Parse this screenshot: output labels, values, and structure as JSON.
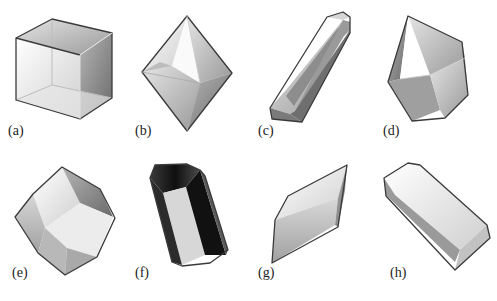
{
  "figure": {
    "panels": [
      {
        "id": "a",
        "label": "(a)",
        "shape": "cube"
      },
      {
        "id": "b",
        "label": "(b)",
        "shape": "octahedron"
      },
      {
        "id": "c",
        "label": "(c)",
        "shape": "elongated prism"
      },
      {
        "id": "d",
        "label": "(d)",
        "shape": "irregular polyhedron"
      },
      {
        "id": "e",
        "label": "(e)",
        "shape": "rhombic dodecahedron"
      },
      {
        "id": "f",
        "label": "(f)",
        "shape": "dark hexagonal prism"
      },
      {
        "id": "g",
        "label": "(g)",
        "shape": "rhombohedron"
      },
      {
        "id": "h",
        "label": "(h)",
        "shape": "rectangular bar"
      }
    ]
  },
  "colors": {
    "background": "#ffffff",
    "edge": "#3a3a3a",
    "light_face": "#f2f2f2",
    "mid_face": "#c8c8c8",
    "dark_face": "#8a8a8a",
    "black_face": "#1a1a1a"
  }
}
